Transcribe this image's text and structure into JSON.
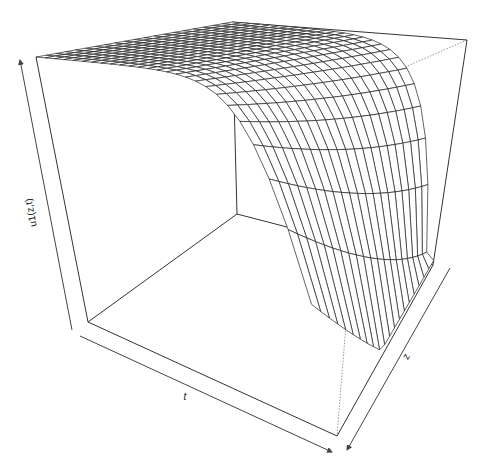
{
  "chart_data": {
    "type": "surface3d",
    "title": "",
    "xlabel": "t",
    "ylabel": "z",
    "zlabel": "u1(z,t)",
    "grid": false,
    "style": "wireframe perspective plot (R persp)",
    "mesh": {
      "n_t": 25,
      "n_z": 20
    },
    "surface": {
      "plateau_value": 1.0,
      "min_value": 0.0,
      "front_shape": "exponential decay in t and z"
    },
    "box": {
      "top_front_left": [
        36,
        57
      ],
      "top_back": [
        232,
        22
      ],
      "top_right": [
        467,
        40
      ],
      "top_front_right": [
        268,
        78
      ],
      "bottom_front_left": [
        88,
        322
      ],
      "bottom_inner": [
        237,
        214
      ],
      "bottom_right": [
        433,
        265
      ],
      "bottom_front": [
        337,
        436
      ]
    },
    "colors": {
      "line": "#222222",
      "hidden": "#999999",
      "background": "#ffffff"
    }
  },
  "labels": {
    "t": "t",
    "z": "z",
    "u": "u1(z,t)"
  }
}
